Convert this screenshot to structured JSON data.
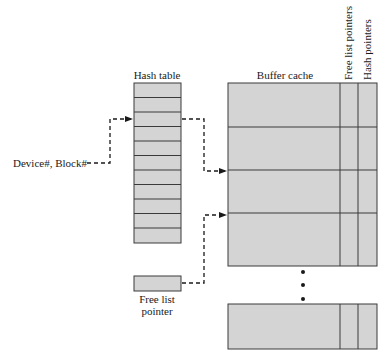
{
  "diagram": {
    "labels": {
      "hash_table": "Hash table",
      "buffer_cache": "Buffer cache",
      "free_list_pointers": "Free list pointers",
      "hash_pointers": "Hash pointers",
      "device_block": "Device#, Block#",
      "free_list_pointer_line1": "Free list",
      "free_list_pointer_line2": "pointer"
    },
    "hash_table": {
      "cell_count": 11
    },
    "buffer_cache": {
      "visible_rows": 4,
      "trailing_rows": 1,
      "ellipsis_dots": 3
    },
    "colors": {
      "fill": "#d4d4d4",
      "stroke": "#3a3a3a",
      "text": "#1a1a1a"
    }
  }
}
